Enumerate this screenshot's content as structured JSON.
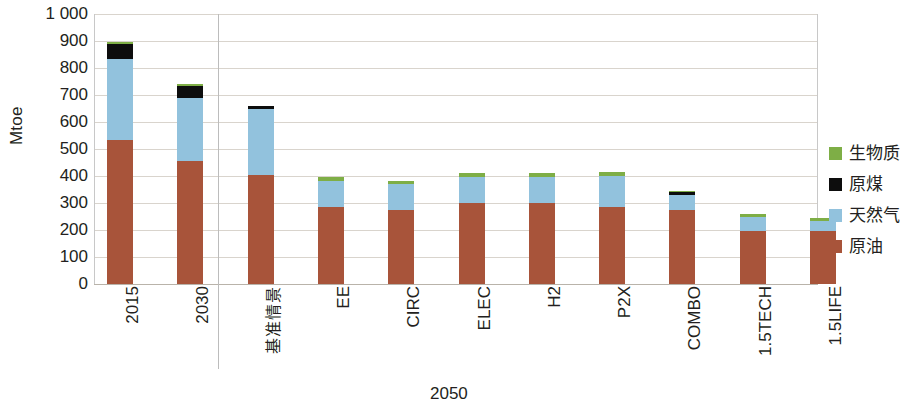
{
  "chart_data": {
    "type": "bar",
    "subtype": "stacked-bar",
    "title": "",
    "xlabel": "",
    "ylabel": "Mtoe",
    "ylim": [
      0,
      1000
    ],
    "ytick_step": 100,
    "ytick_labels": [
      "1 000",
      "900",
      "800",
      "700",
      "600",
      "500",
      "400",
      "300",
      "200",
      "100",
      "0"
    ],
    "grid": true,
    "legend_position": "right",
    "categories": [
      "2015",
      "2030",
      "基准情景",
      "EE",
      "CIRC",
      "ELEC",
      "H2",
      "P2X",
      "COMBO",
      "1.5TECH",
      "1.5LIFE"
    ],
    "group_labels": [
      {
        "label": "2050",
        "categories": [
          "基准情景",
          "EE",
          "CIRC",
          "ELEC",
          "H2",
          "P2X",
          "COMBO",
          "1.5TECH",
          "1.5LIFE"
        ]
      }
    ],
    "series": [
      {
        "name": "原油",
        "color": "#a8543a",
        "values": [
          535,
          455,
          405,
          285,
          275,
          300,
          300,
          285,
          275,
          195,
          195
        ]
      },
      {
        "name": "天然气",
        "color": "#92c2dd",
        "values": [
          300,
          235,
          245,
          95,
          95,
          95,
          95,
          115,
          55,
          55,
          40
        ]
      },
      {
        "name": "原煤",
        "color": "#0d0d0d",
        "values": [
          55,
          45,
          10,
          0,
          0,
          0,
          0,
          0,
          10,
          0,
          0
        ]
      },
      {
        "name": "生物质",
        "color": "#7eae46",
        "values": [
          5,
          5,
          0,
          15,
          10,
          15,
          15,
          15,
          5,
          10,
          10
        ]
      }
    ],
    "totals": [
      895,
      740,
      660,
      395,
      380,
      410,
      410,
      415,
      345,
      260,
      245
    ],
    "stack_order_bottom_to_top": [
      "原油",
      "天然气",
      "原煤",
      "生物质"
    ]
  },
  "legend": {
    "items": [
      {
        "label": "生物质",
        "color": "#7eae46"
      },
      {
        "label": "原煤",
        "color": "#0d0d0d"
      },
      {
        "label": "天然气",
        "color": "#92c2dd"
      },
      {
        "label": "原油",
        "color": "#a8543a"
      }
    ]
  },
  "axis": {
    "y_title": "Mtoe"
  },
  "colors": {
    "biomass": "#7eae46",
    "coal": "#0d0d0d",
    "natural_gas": "#92c2dd",
    "crude_oil": "#a8543a",
    "gridline": "#d9d4cd",
    "text": "#231f20"
  }
}
